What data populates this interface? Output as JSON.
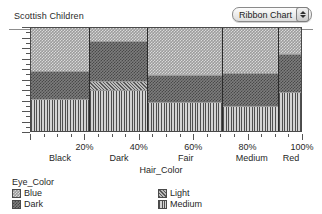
{
  "window": {
    "title": "Scottish Children"
  },
  "toolbar": {
    "chart_type_label": "Ribbon Chart",
    "stepper_up_icon": "triangle-up-icon",
    "stepper_down_icon": "triangle-down-icon"
  },
  "axes": {
    "x_title": "Hair_Color",
    "x_percent_labels": [
      "20%",
      "40%",
      "60%",
      "80%",
      "100%"
    ],
    "x_category_labels": [
      "Black",
      "Dark",
      "Fair",
      "Medium",
      "Red"
    ]
  },
  "legend": {
    "title": "Eye_Color",
    "entries": [
      {
        "label": "Blue",
        "pattern": "checker-light",
        "color": "#9c9c9c"
      },
      {
        "label": "Dark",
        "pattern": "checker-dark",
        "color": "#7d7d7d"
      },
      {
        "label": "Light",
        "pattern": "diagonal",
        "color": "#8a8a8a"
      },
      {
        "label": "Medium",
        "pattern": "vertical",
        "color": "#b5b5b5"
      }
    ]
  },
  "chart_data": {
    "type": "bar",
    "variant": "mosaic-ribbon",
    "title": "Scottish Children",
    "xlabel": "Hair_Color",
    "ylabel": "",
    "xlim": [
      0,
      100
    ],
    "ylim": [
      0,
      100
    ],
    "grid": false,
    "legend_position": "bottom",
    "x_tick_labels": [
      "20%",
      "40%",
      "60%",
      "80%",
      "100%"
    ],
    "x_tick_values": [
      20,
      40,
      60,
      80,
      100
    ],
    "categories": [
      "Black",
      "Dark",
      "Fair",
      "Medium",
      "Red"
    ],
    "category_widths_pct": [
      22.0,
      21.5,
      27.5,
      21.0,
      8.0
    ],
    "series": [
      {
        "name": "Blue",
        "values": [
          43,
          14,
          47,
          45,
          26
        ]
      },
      {
        "name": "Dark",
        "values": [
          27,
          38,
          26,
          32,
          37
        ]
      },
      {
        "name": "Light",
        "values": [
          0,
          9,
          0,
          0,
          0
        ]
      },
      {
        "name": "Medium",
        "values": [
          30,
          39,
          27,
          23,
          37
        ]
      }
    ],
    "stack_order_bottom_to_top": [
      "Medium",
      "Light",
      "Dark",
      "Blue"
    ],
    "annotations": []
  }
}
